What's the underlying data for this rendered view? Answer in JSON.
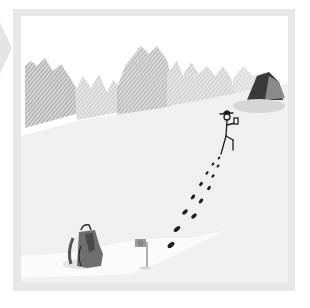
{
  "scene": {
    "description": "Illustration of a stick-figure hiker walking up a snowy hillside leaving footprints, with a backpack and a small flag at the start and a boulder near the treeline.",
    "colors": {
      "frame": "#e8e8e8",
      "snow": "#f0f0f0",
      "snow_highlight": "#fbfbfb",
      "trees": "#9a9a9a",
      "boulder_dark": "#3a3a3a",
      "boulder_light": "#8a8a8a",
      "footprints": "#1e1e1e",
      "backpack": "#6e6e6e"
    }
  }
}
